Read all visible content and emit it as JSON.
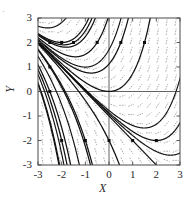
{
  "figure": {
    "corner_mark": "·",
    "background_color": "#ffffff",
    "frame_color": "#4a4a4a",
    "curve_color": "#111111",
    "field_color": "#8e8e8e",
    "marker_color": "#0d0d0d"
  },
  "chart_data": {
    "type": "line",
    "title": "",
    "subtitle": "",
    "xlabel": "X",
    "ylabel": "Y",
    "xlim": [
      -3,
      3
    ],
    "ylim": [
      -3,
      3
    ],
    "xticks": [
      -3,
      -2,
      -1,
      0,
      1,
      2,
      3
    ],
    "yticks": [
      -3,
      -2,
      -1,
      0,
      1,
      2,
      3
    ],
    "xticklabels": [
      "-3",
      "-2",
      "-1",
      "0",
      "1",
      "2",
      "3"
    ],
    "yticklabels": [
      "-3",
      "-2",
      "-1",
      "0",
      "1",
      "2",
      "3"
    ],
    "grid": false,
    "legend": "none",
    "annotations": [
      "Direction field (short dashed line segments) overlaid with solid solution trajectories",
      "Trajectories converge asymptotically to the line Y = X toward the upper-right corner",
      "Zero axes drawn as thin horizontal line at Y = 0 and vertical line at X = 0"
    ],
    "field": {
      "description": "slope field of dashed tick marks on a regular grid",
      "style": "dashed",
      "grid_step": 0.375,
      "segment_length": 0.26,
      "slope_formula": "dy/dx = x + y"
    },
    "series": [
      {
        "name": "trajectory-1",
        "initial_point": [
          -2.5,
          2.0
        ],
        "values_note": "solution through (-2.5, 2)"
      },
      {
        "name": "trajectory-2",
        "initial_point": [
          -2.5,
          1.0
        ],
        "values_note": "solution through (-2.5, 1)"
      },
      {
        "name": "trajectory-3",
        "initial_point": [
          -2.5,
          0.0
        ],
        "values_note": "solution through (-2.5, 0)"
      },
      {
        "name": "trajectory-4",
        "initial_point": [
          -2.0,
          2.0
        ],
        "values_note": "solution through (-2, 2)"
      },
      {
        "name": "trajectory-5",
        "initial_point": [
          -1.5,
          2.0
        ],
        "values_note": "solution through (-1.5, 2)"
      },
      {
        "name": "trajectory-6",
        "initial_point": [
          -0.5,
          2.0
        ],
        "values_note": "solution through (-0.5, 2)"
      },
      {
        "name": "trajectory-7",
        "initial_point": [
          0.5,
          2.0
        ],
        "values_note": "solution through (0.5, 2)"
      },
      {
        "name": "trajectory-8",
        "initial_point": [
          1.5,
          2.0
        ],
        "values_note": "solution through (1.5, 2)"
      },
      {
        "name": "trajectory-9",
        "initial_point": [
          -2.0,
          -2.0
        ],
        "values_note": "solution through (-2, -2)"
      },
      {
        "name": "trajectory-10",
        "initial_point": [
          -1.0,
          -2.0
        ],
        "values_note": "solution through (-1, -2)"
      },
      {
        "name": "trajectory-11",
        "initial_point": [
          0.0,
          -2.0
        ],
        "values_note": "solution through (0, -2)"
      },
      {
        "name": "trajectory-12",
        "initial_point": [
          1.0,
          -2.0
        ],
        "values_note": "solution through (1, -2)"
      },
      {
        "name": "trajectory-13",
        "initial_point": [
          2.0,
          -2.0
        ],
        "values_note": "solution through (2, -2)"
      }
    ],
    "markers": {
      "shape": "square-dot",
      "size": 3,
      "points": [
        [
          -2.5,
          2.0
        ],
        [
          -2.0,
          2.0
        ],
        [
          -1.5,
          2.0
        ],
        [
          -0.5,
          2.0
        ],
        [
          0.5,
          2.0
        ],
        [
          1.5,
          2.0
        ],
        [
          -2.5,
          1.0
        ],
        [
          -2.5,
          0.0
        ],
        [
          -2.0,
          -2.0
        ],
        [
          -1.0,
          -2.0
        ],
        [
          0.0,
          -2.0
        ],
        [
          1.0,
          -2.0
        ],
        [
          2.0,
          -2.0
        ]
      ]
    }
  }
}
